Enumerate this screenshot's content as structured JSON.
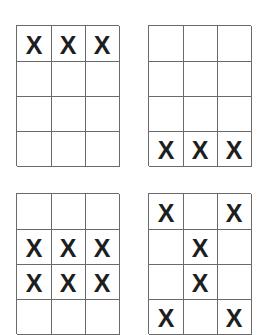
{
  "mark_symbol": "X",
  "line_color": "#6a6a6a",
  "mark_color": "#1e1e1e",
  "grids": [
    {
      "position": "top-left",
      "rows": 4,
      "cols": 3,
      "cells": [
        [
          "X",
          "X",
          "X"
        ],
        [
          "",
          "",
          ""
        ],
        [
          "",
          "",
          ""
        ],
        [
          "",
          "",
          ""
        ]
      ]
    },
    {
      "position": "top-right",
      "rows": 4,
      "cols": 3,
      "cells": [
        [
          "",
          "",
          ""
        ],
        [
          "",
          "",
          ""
        ],
        [
          "",
          "",
          ""
        ],
        [
          "X",
          "X",
          "X"
        ]
      ]
    },
    {
      "position": "bottom-left",
      "rows": 4,
      "cols": 3,
      "cells": [
        [
          "",
          "",
          ""
        ],
        [
          "X",
          "X",
          "X"
        ],
        [
          "X",
          "X",
          "X"
        ],
        [
          "",
          "",
          ""
        ]
      ]
    },
    {
      "position": "bottom-right",
      "rows": 4,
      "cols": 3,
      "cells": [
        [
          "X",
          "",
          "X"
        ],
        [
          "",
          "X",
          ""
        ],
        [
          "",
          "X",
          ""
        ],
        [
          "X",
          "",
          "X"
        ]
      ]
    }
  ]
}
